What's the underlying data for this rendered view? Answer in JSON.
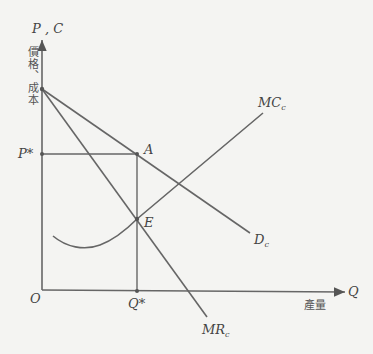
{
  "diagram": {
    "type": "monopoly equilibrium (economics)",
    "colors": {
      "background": "#f4f4f2",
      "line": "#666666",
      "text": "#444444"
    },
    "axes": {
      "y_label": "P , C",
      "y_sublabel": "價格、成本",
      "x_label": "Q",
      "x_sublabel": "產量",
      "origin_label": "O"
    },
    "markers": {
      "price": "P*",
      "quantity": "Q*"
    },
    "points": {
      "A": "A",
      "E": "E"
    },
    "curves": {
      "mc": {
        "main": "MC",
        "sub": "c"
      },
      "demand": {
        "main": "D",
        "sub": "c"
      },
      "mr": {
        "main": "MR",
        "sub": "c"
      }
    }
  }
}
